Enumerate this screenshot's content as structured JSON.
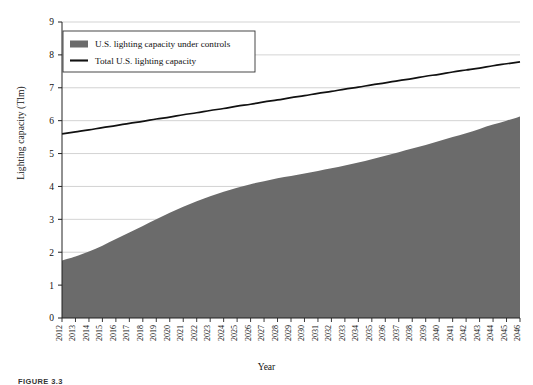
{
  "figure": {
    "caption": "FIGURE 3.3"
  },
  "axis": {
    "y_title": "Lighting capacity (Tlm)",
    "x_title": "Year"
  },
  "chart_data": {
    "type": "area",
    "title": "",
    "subtitle": "",
    "xlabel": "Year",
    "ylabel": "Lighting capacity (Tlm)",
    "ylim": [
      0,
      9
    ],
    "yticks": [
      0,
      1,
      2,
      3,
      4,
      5,
      6,
      7,
      8,
      9
    ],
    "grid": true,
    "legend_position": "top-left",
    "colors": {
      "area_fill": "#6b6b6b",
      "line_stroke": "#111111",
      "gridline": "#c8c8c8",
      "axis": "#222222",
      "background": "#ffffff"
    },
    "categories": [
      "2012",
      "2013",
      "2014",
      "2015",
      "2016",
      "2017",
      "2018",
      "2019",
      "2020",
      "2021",
      "2022",
      "2023",
      "2024",
      "2025",
      "2026",
      "2027",
      "2028",
      "2029",
      "2030",
      "2031",
      "2032",
      "2033",
      "2034",
      "2035",
      "2036",
      "2037",
      "2038",
      "2039",
      "2040",
      "2041",
      "2042",
      "2043",
      "2044",
      "2045",
      "2046"
    ],
    "series": [
      {
        "name": "U.S. lighting capacity under controls",
        "type": "area",
        "values": [
          1.75,
          1.87,
          2.02,
          2.2,
          2.4,
          2.6,
          2.8,
          3.0,
          3.2,
          3.38,
          3.55,
          3.7,
          3.84,
          3.96,
          4.07,
          4.16,
          4.25,
          4.32,
          4.39,
          4.47,
          4.55,
          4.64,
          4.73,
          4.83,
          4.93,
          5.04,
          5.15,
          5.26,
          5.38,
          5.5,
          5.62,
          5.75,
          5.88,
          6.0,
          6.13
        ]
      },
      {
        "name": "Total U.S. lighting capacity",
        "type": "line",
        "values": [
          5.6,
          5.66,
          5.72,
          5.79,
          5.85,
          5.92,
          5.98,
          6.05,
          6.11,
          6.18,
          6.24,
          6.31,
          6.37,
          6.44,
          6.5,
          6.57,
          6.63,
          6.7,
          6.76,
          6.83,
          6.89,
          6.96,
          7.02,
          7.09,
          7.15,
          7.22,
          7.28,
          7.35,
          7.41,
          7.48,
          7.54,
          7.6,
          7.67,
          7.73,
          7.79
        ]
      }
    ],
    "legend": [
      {
        "label": "U.S. lighting capacity under controls",
        "marker": "filled-swatch",
        "color": "#6b6b6b"
      },
      {
        "label": "Total U.S. lighting capacity",
        "marker": "line",
        "color": "#111111"
      }
    ]
  }
}
